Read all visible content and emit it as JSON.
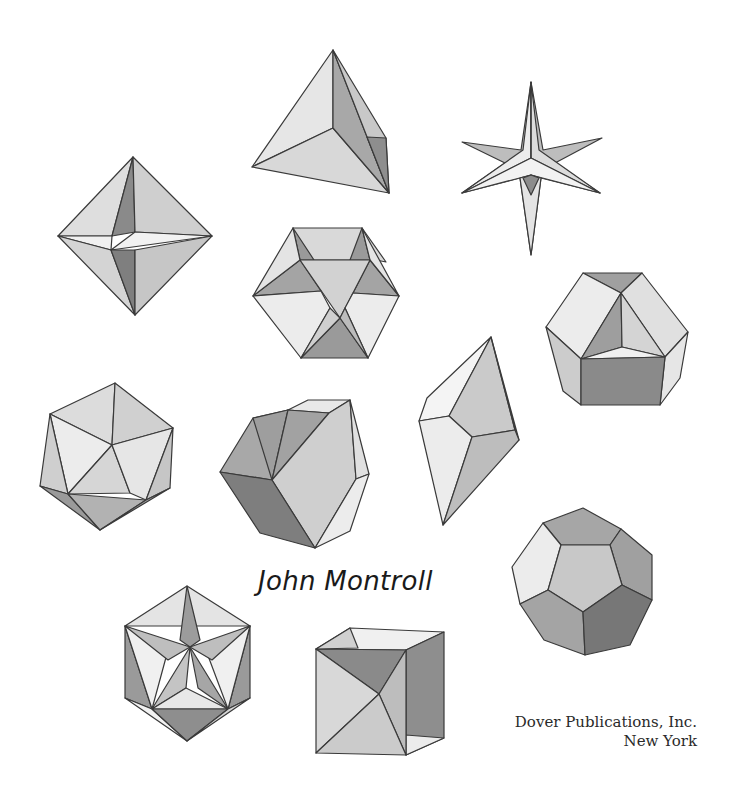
{
  "author": "John Montroll",
  "publisher": {
    "name": "Dover Publications, Inc.",
    "city": "New York"
  },
  "illustrations": [
    {
      "id": "tetrahedron",
      "label": "tetrahedron-illustration"
    },
    {
      "id": "stellated-star",
      "label": "star-polyhedron-illustration"
    },
    {
      "id": "octahedron",
      "label": "octahedron-illustration"
    },
    {
      "id": "hexagonal-polyhedron",
      "label": "hexagonal-polyhedron-illustration"
    },
    {
      "id": "pentagonal-polyhedron",
      "label": "pentagonal-polyhedron-illustration"
    },
    {
      "id": "icosahedron",
      "label": "icosahedron-illustration"
    },
    {
      "id": "cuboctahedron",
      "label": "cuboctahedron-illustration"
    },
    {
      "id": "crystal",
      "label": "crystal-illustration"
    },
    {
      "id": "dodecahedron",
      "label": "dodecahedron-illustration"
    },
    {
      "id": "great-icosahedron",
      "label": "great-icosahedron-illustration"
    },
    {
      "id": "open-cube",
      "label": "open-cube-illustration"
    }
  ],
  "colors": {
    "light": "#e9e9e9",
    "mid": "#c9c9c9",
    "dark": "#9d9d9d",
    "darker": "#7e7e7e",
    "edge": "#3a3a3a"
  }
}
